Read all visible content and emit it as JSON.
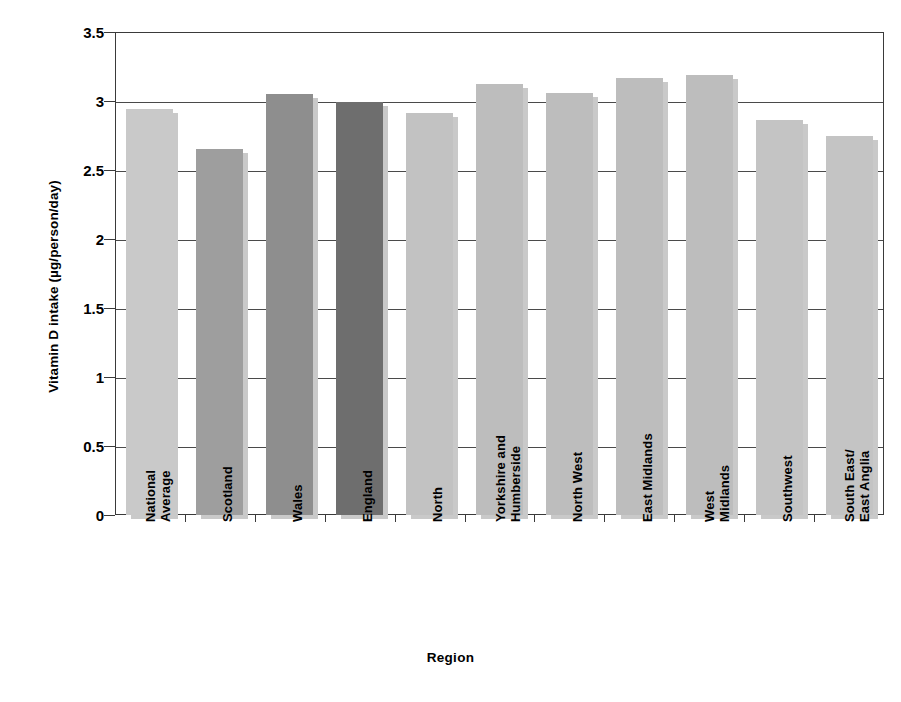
{
  "chart_data": {
    "type": "bar",
    "title": "",
    "xlabel": "Region",
    "ylabel": "Vitamin D intake (µg/person/day)",
    "ylim": [
      0,
      3.5
    ],
    "ytick_labels": [
      "0",
      "0.5",
      "1",
      "1.5",
      "2",
      "2.5",
      "3",
      "3.5"
    ],
    "ytick_values": [
      0,
      0.5,
      1,
      1.5,
      2,
      2.5,
      3,
      3.5
    ],
    "grid": true,
    "legend": "none",
    "categories": [
      "National Average",
      "Scotland",
      "Wales",
      "England",
      "North",
      "Yorkshire and Humberside",
      "North West",
      "East Midlands",
      "West Midlands",
      "Southwest",
      "South East/ East Anglia"
    ],
    "category_lines": [
      [
        "National",
        "Average"
      ],
      [
        "Scotland",
        ""
      ],
      [
        "Wales",
        ""
      ],
      [
        "England",
        ""
      ],
      [
        "North",
        ""
      ],
      [
        "Yorkshire and",
        "Humberside"
      ],
      [
        "North West",
        ""
      ],
      [
        "East Midlands",
        ""
      ],
      [
        "West",
        "Midlands"
      ],
      [
        "Southwest",
        ""
      ],
      [
        "South East/",
        "East Anglia"
      ]
    ],
    "values": [
      2.94,
      2.65,
      3.05,
      2.99,
      2.91,
      3.12,
      3.06,
      3.17,
      3.19,
      2.86,
      2.75
    ],
    "bar_colors": [
      "#c9c9c9",
      "#9e9e9e",
      "#8e8e8e",
      "#6e6e6e",
      "#c2c2c2",
      "#bdbdbd",
      "#bdbdbd",
      "#bdbdbd",
      "#bdbdbd",
      "#c4c4c4",
      "#c4c4c4"
    ],
    "shadow_color": "#c9c9c9",
    "axis_color": "#3a3a3a",
    "background": "#ffffff"
  }
}
